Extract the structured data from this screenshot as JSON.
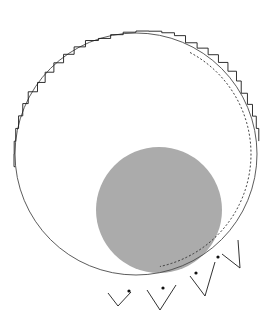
{
  "figure": {
    "background_color": "#ffffff",
    "width": 274,
    "height": 321,
    "outer_circle": {
      "label": "outer-circle",
      "center_x": 136,
      "center_y": 154,
      "radius": 121,
      "stroke_color": "#4a4a4a",
      "stroke_width": 0.9,
      "fill": "none"
    },
    "gray_disk": {
      "label": "gray-disk",
      "center_x": 159,
      "center_y": 210,
      "radius": 63,
      "fill_color": "#ababab",
      "stroke": "none"
    },
    "dashed_curve": {
      "label": "dashed-inner-arc",
      "center_x": 136,
      "center_y": 154,
      "radius": 115,
      "stroke_color": "#2a2a2a",
      "stroke_width": 0.9,
      "dash_pattern": "2,2",
      "start_angle_deg": -62,
      "end_angle_deg": 78
    },
    "jagged_boundary": {
      "label": "jagged-polygon-boundary",
      "stroke_color": "#1a1a1a",
      "stroke_width": 0.9,
      "fill": "none",
      "description": "Stair-stepped polyline tracing the circle from top through right to bottom, with triangular spikes growing larger toward the lower right",
      "step_angles_deg": [
        -96,
        -90,
        -84,
        -78,
        -72,
        -66,
        -60,
        -54,
        -48,
        -42,
        -36,
        -30,
        -24,
        -18,
        -12,
        -6,
        0,
        6,
        12,
        18,
        24,
        30,
        36,
        42,
        48,
        54,
        60,
        66,
        72,
        78,
        84
      ],
      "spike_count": 4
    },
    "markers": {
      "label": "vertex-markers",
      "color": "#111111",
      "radius": 1.6,
      "points": [
        {
          "x": 129,
          "y": 291
        },
        {
          "x": 163,
          "y": 288
        },
        {
          "x": 196,
          "y": 273
        },
        {
          "x": 218,
          "y": 257
        }
      ]
    },
    "spikes": [
      {
        "label": "spike-1",
        "base_a_x": 108,
        "base_a_y": 293,
        "apex_x": 118,
        "apex_y": 306,
        "base_b_x": 131,
        "base_b_y": 292
      },
      {
        "label": "spike-2",
        "base_a_x": 147,
        "base_a_y": 290,
        "apex_x": 160,
        "apex_y": 310,
        "base_b_x": 176,
        "base_b_y": 285
      },
      {
        "label": "spike-3",
        "base_a_x": 190,
        "base_a_y": 276,
        "apex_x": 205,
        "apex_y": 296,
        "base_b_x": 215,
        "base_b_y": 262
      },
      {
        "label": "spike-4",
        "base_a_x": 222,
        "base_a_y": 254,
        "apex_x": 240,
        "apex_y": 268,
        "base_b_x": 238,
        "base_b_y": 240
      }
    ]
  }
}
